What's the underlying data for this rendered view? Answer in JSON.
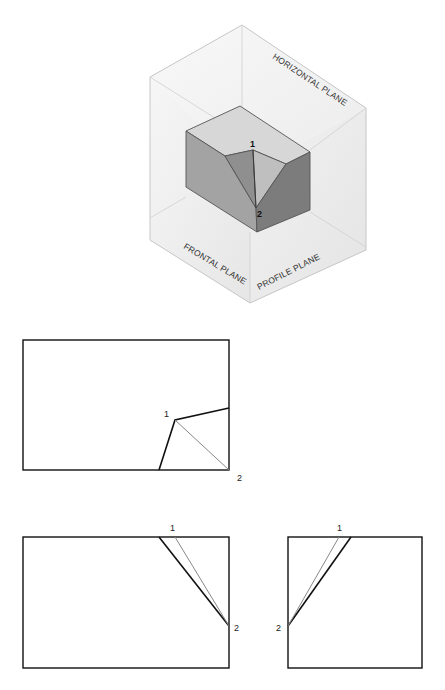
{
  "figure": {
    "type": "orthographic-projection-diagram",
    "pictorial": {
      "planes": {
        "horizontal": "HORIZONTAL PLANE",
        "frontal": "FRONTAL PLANE",
        "profile": "PROFILE PLANE"
      },
      "points": {
        "p1": "1",
        "p2": "2"
      },
      "colors": {
        "plane_fill": "#efefef",
        "plane_edge": "#c8c8c8",
        "block_top": "#d7d7d7",
        "block_front": "#a3a3a3",
        "notch_left": "#8f8f8f",
        "notch_right": "#bfbfbf",
        "block_right": "#7c7c7c",
        "block_edge": "#555555"
      }
    },
    "views": {
      "top": {
        "name": "top-view",
        "points": {
          "p1": "1",
          "p2": "2"
        }
      },
      "front": {
        "name": "front-view",
        "points": {
          "p1": "1",
          "p2": "2"
        }
      },
      "side": {
        "name": "side-view",
        "points": {
          "p1": "1",
          "p2": "2"
        }
      }
    },
    "line_colors": {
      "visible": "#111111",
      "true_line": "#888888"
    }
  }
}
